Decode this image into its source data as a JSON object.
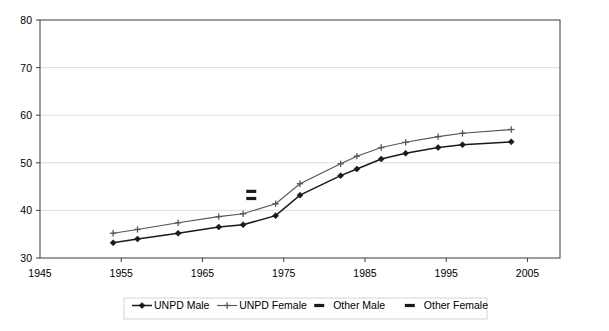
{
  "chart_data": {
    "type": "line",
    "title": "",
    "subtitle": "",
    "xlabel": "",
    "ylabel": "",
    "xlim": [
      1945,
      2009
    ],
    "ylim": [
      30,
      80
    ],
    "x_ticks": [
      1945,
      1955,
      1965,
      1975,
      1985,
      1995,
      2005
    ],
    "y_ticks": [
      30,
      40,
      50,
      60,
      70,
      80
    ],
    "grid": "horizontal",
    "legend_position": "bottom",
    "series": [
      {
        "name": "UNPD Male",
        "style": "line-marker",
        "color": "#1a1a1a",
        "marker": "diamond",
        "x": [
          1954,
          1957,
          1962,
          1967,
          1970,
          1974,
          1977,
          1982,
          1984,
          1987,
          1990,
          1994,
          1997,
          2003
        ],
        "values": [
          33.2,
          34.0,
          35.2,
          36.5,
          37.0,
          38.9,
          43.2,
          47.3,
          48.7,
          50.8,
          52.0,
          53.2,
          53.8,
          54.4
        ]
      },
      {
        "name": "UNPD Female",
        "style": "line-marker",
        "color": "#555555",
        "marker": "plus",
        "x": [
          1954,
          1957,
          1962,
          1967,
          1970,
          1974,
          1977,
          1982,
          1984,
          1987,
          1990,
          1994,
          1997,
          2003
        ],
        "values": [
          35.2,
          36.0,
          37.4,
          38.7,
          39.3,
          41.4,
          45.6,
          49.8,
          51.4,
          53.2,
          54.3,
          55.5,
          56.2,
          57.0
        ]
      },
      {
        "name": "Other Male",
        "style": "marker-only",
        "color": "#1a1a1a",
        "marker": "dash",
        "x": [
          1971
        ],
        "values": [
          42.5
        ]
      },
      {
        "name": "Other Female",
        "style": "marker-only",
        "color": "#1a1a1a",
        "marker": "dash",
        "x": [
          1971
        ],
        "values": [
          44.0
        ]
      }
    ],
    "legend_entries": [
      {
        "label": "UNPD Male",
        "marker": "diamond",
        "has_line": true,
        "color": "#1a1a1a"
      },
      {
        "label": "UNPD Female",
        "marker": "plus",
        "has_line": true,
        "color": "#555555"
      },
      {
        "label": "Other Male",
        "marker": "dash",
        "has_line": false,
        "color": "#1a1a1a"
      },
      {
        "label": "Other Female",
        "marker": "dash",
        "has_line": false,
        "color": "#1a1a1a"
      }
    ]
  },
  "axis": {
    "y_tick_labels": [
      "80",
      "70",
      "60",
      "50",
      "40",
      "30"
    ],
    "x_tick_labels": [
      "1945",
      "1955",
      "1965",
      "1975",
      "1985",
      "1995",
      "2005"
    ]
  },
  "legend": {
    "items": [
      {
        "label": "UNPD Male"
      },
      {
        "label": "UNPD Female"
      },
      {
        "label": "Other Male"
      },
      {
        "label": "Other Female"
      }
    ]
  },
  "colors": {
    "male_line": "#1a1a1a",
    "female_line": "#555555",
    "gridline": "#d9d9d9",
    "axis": "#4d4d4d",
    "background": "#ffffff"
  }
}
